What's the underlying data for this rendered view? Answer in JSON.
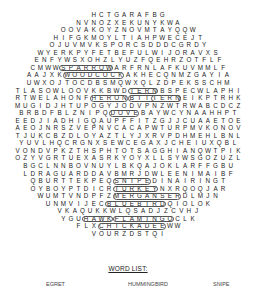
{
  "puzzle": {
    "rows": [
      "HCTGARAFBG",
      "NVNOZXEKUNYKWA",
      "OOVAKOYZNOVMTAYQQW",
      "HIFGKMOYLTIAHPWECEJT",
      "OJUVMVKSPORCSDDDCGRDY",
      "WYERKPYFETBEFULWIJORAVXS",
      "ENFYWSXOHZLYUZFQEHRZOTFLF",
      "CMWWSPARROWARFRNLAFKUVMMLF",
      "AAJXKWOODCOCKAKHECQNMZGAYIA",
      "UWXOJTOCDBSMQWXQLZDPEKSSCHM",
      "TLASOWLOOVKKBWDTERNBSPECWLAPHI",
      "RTWELAHONFHERONBITTERNEIKPTRHK",
      "MUGIDJHTUPOGYJODVPNZWTRWABCDCZ",
      "BRBDFBLZNIPQDOVEBAYWCYNAAHHPT",
      "EEDJIADHIGQAUPFFITZGJJCUAAETOE",
      "AEOJNRSZVEPNVCACAPWTURPMVKONOV",
      "TJUKCBZDLOYAZTLYJXRVPDHMEHLBNL",
      "YUVLHQCRGNXSEWCEGAXJCHEIUXQBL",
      "VONDVPKZTHSPHTOTSAGGHIANQWTPIK",
      "OZYVGRTUEXASRKYOYXLLSYWSGOZUZL",
      "BGCLNNBOVNUYLBKQAJOKLARFFGBU",
      "LDRAGUARDDAVBMRJDWLEENIMAIBF",
      "QBURTTEKPEQSNIPEDINAIRINGT",
      "OYBOYPTDICRTURKEYNXRQOQJAR",
      "WUMTVNDPFZMERGANSERDLMJN",
      "UNMVIJECBLUEBIRDQIOLOK",
      "VKAQUKKWLQSADJZCVHJ",
      "YGUHAWKFLAMINGOCLK",
      "FLXCHICKADEEWW",
      "VOURZDSTQI"
    ],
    "found_words_horizontal": [
      "SPARROW",
      "WOODCOCK",
      "TERN",
      "HERON",
      "BITTERN",
      "DOVE",
      "SNIPE",
      "TURKEY",
      "MERGANSER",
      "BLUEBIRD",
      "HAWK",
      "FLAMINGO",
      "CHICKADEE"
    ]
  },
  "word_list": {
    "title": "WORD LIST:",
    "items": [
      "EGRET",
      "HUMMINGBIRD",
      "SNIPE"
    ]
  }
}
